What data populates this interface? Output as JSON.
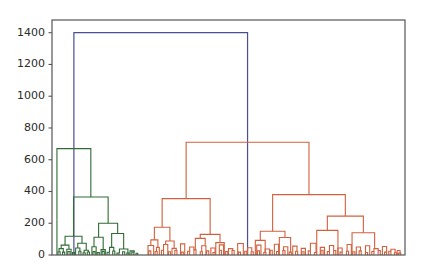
{
  "figure": {
    "background_color": "#ffffff",
    "axes_color": "#555555",
    "tick_label_color": "#2b2b2b"
  },
  "chart_data": {
    "type": "dendrogram",
    "title": "",
    "xlabel": "",
    "ylabel": "",
    "xlim": [
      0,
      100
    ],
    "ylim": [
      0,
      1480
    ],
    "grid": false,
    "legend": null,
    "yticks": [
      0,
      200,
      400,
      600,
      800,
      1000,
      1200,
      1400
    ],
    "ytick_labels": [
      "0",
      "200",
      "400",
      "600",
      "800",
      "1000",
      "1200",
      "1400"
    ],
    "xtick_labels": [],
    "link_colors": {
      "root": "#4a4f93",
      "cluster_green": "#2f6b33",
      "cluster_orange": "#d2603c"
    },
    "root_height": 1400,
    "clusters": [
      {
        "name": "green-cluster",
        "color": "#2f6b33",
        "root_height": 670,
        "x_center": 6.2,
        "x_span": [
          1.4,
          24.3
        ]
      },
      {
        "name": "orange-cluster",
        "color": "#d2603c",
        "root_height": 710,
        "x_center": 55.4,
        "x_span": [
          27.8,
          98.6
        ]
      }
    ],
    "links": [
      {
        "id": "root",
        "color": "#4a4f93",
        "height": 1400,
        "x_left": 6.2,
        "x_right": 55.4
      },
      {
        "id": "g0",
        "color": "#2f6b33",
        "height": 670,
        "x_left": 1.4,
        "x_right": 11.0
      },
      {
        "id": "g1",
        "color": "#2f6b33",
        "height": 225,
        "x_left": 1.4,
        "x_right": 1.4
      },
      {
        "id": "g2",
        "color": "#2f6b33",
        "height": 365,
        "x_left": 6.1,
        "x_right": 15.9
      },
      {
        "id": "g3",
        "color": "#2f6b33",
        "height": 118,
        "x_left": 3.7,
        "x_right": 8.5
      },
      {
        "id": "g4",
        "color": "#2f6b33",
        "height": 200,
        "x_left": 13.2,
        "x_right": 18.6
      },
      {
        "id": "g5",
        "color": "#2f6b33",
        "height": 62,
        "x_left": 2.6,
        "x_right": 4.8
      },
      {
        "id": "g6",
        "color": "#2f6b33",
        "height": 74,
        "x_left": 7.3,
        "x_right": 9.7
      },
      {
        "id": "g7",
        "color": "#2f6b33",
        "height": 112,
        "x_left": 11.9,
        "x_right": 14.5
      },
      {
        "id": "g8",
        "color": "#2f6b33",
        "height": 135,
        "x_left": 16.9,
        "x_right": 20.3
      },
      {
        "id": "g9",
        "color": "#2f6b33",
        "height": 40,
        "x_left": 2.0,
        "x_right": 3.2
      },
      {
        "id": "g10",
        "color": "#2f6b33",
        "height": 36,
        "x_left": 4.2,
        "x_right": 5.4
      },
      {
        "id": "g11",
        "color": "#2f6b33",
        "height": 44,
        "x_left": 6.7,
        "x_right": 7.9
      },
      {
        "id": "g12",
        "color": "#2f6b33",
        "height": 30,
        "x_left": 9.1,
        "x_right": 10.3
      },
      {
        "id": "g13",
        "color": "#2f6b33",
        "height": 52,
        "x_left": 11.3,
        "x_right": 12.5
      },
      {
        "id": "g14",
        "color": "#2f6b33",
        "height": 34,
        "x_left": 13.9,
        "x_right": 15.1
      },
      {
        "id": "g15",
        "color": "#2f6b33",
        "height": 48,
        "x_left": 16.3,
        "x_right": 17.5
      },
      {
        "id": "g16",
        "color": "#2f6b33",
        "height": 38,
        "x_left": 19.1,
        "x_right": 21.5
      },
      {
        "id": "g17",
        "color": "#2f6b33",
        "height": 26,
        "x_left": 22.1,
        "x_right": 23.3
      },
      {
        "id": "g18",
        "color": "#2f6b33",
        "height": 20,
        "x_left": 1.7,
        "x_right": 2.3
      },
      {
        "id": "g19",
        "color": "#2f6b33",
        "height": 18,
        "x_left": 3.0,
        "x_right": 3.6
      },
      {
        "id": "g20",
        "color": "#2f6b33",
        "height": 22,
        "x_left": 4.5,
        "x_right": 5.1
      },
      {
        "id": "g21",
        "color": "#2f6b33",
        "height": 16,
        "x_left": 5.8,
        "x_right": 6.4
      },
      {
        "id": "g22",
        "color": "#2f6b33",
        "height": 24,
        "x_left": 7.6,
        "x_right": 8.2
      },
      {
        "id": "g23",
        "color": "#2f6b33",
        "height": 14,
        "x_left": 8.8,
        "x_right": 9.4
      },
      {
        "id": "g24",
        "color": "#2f6b33",
        "height": 19,
        "x_left": 10.0,
        "x_right": 10.6
      },
      {
        "id": "g25",
        "color": "#2f6b33",
        "height": 21,
        "x_left": 11.6,
        "x_right": 12.2
      },
      {
        "id": "g26",
        "color": "#2f6b33",
        "height": 15,
        "x_left": 12.8,
        "x_right": 13.4
      },
      {
        "id": "g27",
        "color": "#2f6b33",
        "height": 23,
        "x_left": 14.2,
        "x_right": 14.8
      },
      {
        "id": "g28",
        "color": "#2f6b33",
        "height": 17,
        "x_left": 15.6,
        "x_right": 16.2
      },
      {
        "id": "g29",
        "color": "#2f6b33",
        "height": 25,
        "x_left": 17.2,
        "x_right": 17.8
      },
      {
        "id": "g30",
        "color": "#2f6b33",
        "height": 13,
        "x_left": 18.4,
        "x_right": 19.0
      },
      {
        "id": "g31",
        "color": "#2f6b33",
        "height": 20,
        "x_left": 20.0,
        "x_right": 20.6
      },
      {
        "id": "g32",
        "color": "#2f6b33",
        "height": 12,
        "x_left": 21.2,
        "x_right": 21.8
      },
      {
        "id": "g33",
        "color": "#2f6b33",
        "height": 18,
        "x_left": 22.6,
        "x_right": 23.2
      },
      {
        "id": "g34",
        "color": "#2f6b33",
        "height": 11,
        "x_left": 23.8,
        "x_right": 24.3
      },
      {
        "id": "o0",
        "color": "#d2603c",
        "height": 710,
        "x_left": 38.0,
        "x_right": 72.8
      },
      {
        "id": "o1",
        "color": "#d2603c",
        "height": 355,
        "x_left": 31.2,
        "x_right": 44.8
      },
      {
        "id": "o2",
        "color": "#d2603c",
        "height": 380,
        "x_left": 62.5,
        "x_right": 83.1
      },
      {
        "id": "o3",
        "color": "#d2603c",
        "height": 175,
        "x_left": 29.0,
        "x_right": 33.4
      },
      {
        "id": "o4",
        "color": "#d2603c",
        "height": 130,
        "x_left": 42.0,
        "x_right": 47.6
      },
      {
        "id": "o5",
        "color": "#d2603c",
        "height": 150,
        "x_left": 59.0,
        "x_right": 66.0
      },
      {
        "id": "o6",
        "color": "#d2603c",
        "height": 245,
        "x_left": 78.0,
        "x_right": 88.2
      },
      {
        "id": "o7",
        "color": "#d2603c",
        "height": 95,
        "x_left": 28.0,
        "x_right": 30.0
      },
      {
        "id": "o8",
        "color": "#d2603c",
        "height": 88,
        "x_left": 32.2,
        "x_right": 34.6
      },
      {
        "id": "o9",
        "color": "#d2603c",
        "height": 105,
        "x_left": 40.6,
        "x_right": 43.4
      },
      {
        "id": "o10",
        "color": "#d2603c",
        "height": 78,
        "x_left": 46.4,
        "x_right": 48.8
      },
      {
        "id": "o11",
        "color": "#d2603c",
        "height": 92,
        "x_left": 57.6,
        "x_right": 60.4
      },
      {
        "id": "o12",
        "color": "#d2603c",
        "height": 110,
        "x_left": 64.4,
        "x_right": 67.6
      },
      {
        "id": "o13",
        "color": "#d2603c",
        "height": 155,
        "x_left": 75.0,
        "x_right": 81.0
      },
      {
        "id": "o14",
        "color": "#d2603c",
        "height": 140,
        "x_left": 85.0,
        "x_right": 91.4
      },
      {
        "id": "o15",
        "color": "#d2603c",
        "height": 60,
        "x_left": 27.2,
        "x_right": 28.8
      },
      {
        "id": "o16",
        "color": "#d2603c",
        "height": 48,
        "x_left": 29.6,
        "x_right": 30.4
      },
      {
        "id": "o17",
        "color": "#d2603c",
        "height": 66,
        "x_left": 31.6,
        "x_right": 32.8
      },
      {
        "id": "o18",
        "color": "#d2603c",
        "height": 42,
        "x_left": 34.0,
        "x_right": 35.2
      },
      {
        "id": "o19",
        "color": "#d2603c",
        "height": 70,
        "x_left": 36.4,
        "x_right": 37.6
      },
      {
        "id": "o20",
        "color": "#d2603c",
        "height": 50,
        "x_left": 39.0,
        "x_right": 40.2
      },
      {
        "id": "o21",
        "color": "#d2603c",
        "height": 58,
        "x_left": 42.4,
        "x_right": 43.6
      },
      {
        "id": "o22",
        "color": "#d2603c",
        "height": 44,
        "x_left": 45.0,
        "x_right": 46.2
      },
      {
        "id": "o23",
        "color": "#d2603c",
        "height": 64,
        "x_left": 47.4,
        "x_right": 48.6
      },
      {
        "id": "o24",
        "color": "#d2603c",
        "height": 40,
        "x_left": 50.0,
        "x_right": 51.2
      },
      {
        "id": "o25",
        "color": "#d2603c",
        "height": 72,
        "x_left": 52.6,
        "x_right": 54.2
      },
      {
        "id": "o26",
        "color": "#d2603c",
        "height": 46,
        "x_left": 55.4,
        "x_right": 56.6
      },
      {
        "id": "o27",
        "color": "#d2603c",
        "height": 62,
        "x_left": 58.0,
        "x_right": 59.2
      },
      {
        "id": "o28",
        "color": "#d2603c",
        "height": 38,
        "x_left": 60.4,
        "x_right": 61.6
      },
      {
        "id": "o29",
        "color": "#d2603c",
        "height": 68,
        "x_left": 63.0,
        "x_right": 64.2
      },
      {
        "id": "o30",
        "color": "#d2603c",
        "height": 52,
        "x_left": 65.6,
        "x_right": 66.8
      },
      {
        "id": "o31",
        "color": "#d2603c",
        "height": 56,
        "x_left": 68.2,
        "x_right": 69.4
      },
      {
        "id": "o32",
        "color": "#d2603c",
        "height": 42,
        "x_left": 70.6,
        "x_right": 71.8
      },
      {
        "id": "o33",
        "color": "#d2603c",
        "height": 74,
        "x_left": 73.2,
        "x_right": 74.8
      },
      {
        "id": "o34",
        "color": "#d2603c",
        "height": 48,
        "x_left": 76.0,
        "x_right": 77.2
      },
      {
        "id": "o35",
        "color": "#d2603c",
        "height": 60,
        "x_left": 78.6,
        "x_right": 79.8
      },
      {
        "id": "o36",
        "color": "#d2603c",
        "height": 44,
        "x_left": 81.0,
        "x_right": 82.2
      },
      {
        "id": "o37",
        "color": "#d2603c",
        "height": 66,
        "x_left": 83.6,
        "x_right": 84.8
      },
      {
        "id": "o38",
        "color": "#d2603c",
        "height": 50,
        "x_left": 86.2,
        "x_right": 87.4
      },
      {
        "id": "o39",
        "color": "#d2603c",
        "height": 58,
        "x_left": 88.8,
        "x_right": 90.0
      },
      {
        "id": "o40",
        "color": "#d2603c",
        "height": 40,
        "x_left": 91.2,
        "x_right": 92.4
      },
      {
        "id": "o41",
        "color": "#d2603c",
        "height": 54,
        "x_left": 93.6,
        "x_right": 94.8
      },
      {
        "id": "o42",
        "color": "#d2603c",
        "height": 36,
        "x_left": 96.0,
        "x_right": 97.2
      },
      {
        "id": "o43",
        "color": "#d2603c",
        "height": 28,
        "x_left": 97.8,
        "x_right": 98.6
      },
      {
        "id": "o44",
        "color": "#d2603c",
        "height": 26,
        "x_left": 27.4,
        "x_right": 28.0
      },
      {
        "id": "o45",
        "color": "#d2603c",
        "height": 22,
        "x_left": 29.2,
        "x_right": 29.8
      },
      {
        "id": "o46",
        "color": "#d2603c",
        "height": 30,
        "x_left": 31.0,
        "x_right": 31.6
      },
      {
        "id": "o47",
        "color": "#d2603c",
        "height": 20,
        "x_left": 33.0,
        "x_right": 33.6
      },
      {
        "id": "o48",
        "color": "#d2603c",
        "height": 28,
        "x_left": 34.8,
        "x_right": 35.4
      },
      {
        "id": "o49",
        "color": "#d2603c",
        "height": 18,
        "x_left": 36.6,
        "x_right": 37.2
      },
      {
        "id": "o50",
        "color": "#d2603c",
        "height": 24,
        "x_left": 38.4,
        "x_right": 39.0
      },
      {
        "id": "o51",
        "color": "#d2603c",
        "height": 32,
        "x_left": 40.2,
        "x_right": 40.8
      },
      {
        "id": "o52",
        "color": "#d2603c",
        "height": 20,
        "x_left": 42.0,
        "x_right": 42.6
      },
      {
        "id": "o53",
        "color": "#d2603c",
        "height": 26,
        "x_left": 43.8,
        "x_right": 44.4
      },
      {
        "id": "o54",
        "color": "#d2603c",
        "height": 16,
        "x_left": 45.6,
        "x_right": 46.2
      },
      {
        "id": "o55",
        "color": "#d2603c",
        "height": 30,
        "x_left": 47.4,
        "x_right": 48.0
      },
      {
        "id": "o56",
        "color": "#d2603c",
        "height": 22,
        "x_left": 49.2,
        "x_right": 49.8
      },
      {
        "id": "o57",
        "color": "#d2603c",
        "height": 28,
        "x_left": 51.0,
        "x_right": 51.6
      },
      {
        "id": "o58",
        "color": "#d2603c",
        "height": 18,
        "x_left": 52.8,
        "x_right": 53.4
      },
      {
        "id": "o59",
        "color": "#d2603c",
        "height": 24,
        "x_left": 54.6,
        "x_right": 55.2
      },
      {
        "id": "o60",
        "color": "#d2603c",
        "height": 20,
        "x_left": 56.4,
        "x_right": 57.0
      },
      {
        "id": "o61",
        "color": "#d2603c",
        "height": 26,
        "x_left": 58.2,
        "x_right": 58.8
      },
      {
        "id": "o62",
        "color": "#d2603c",
        "height": 16,
        "x_left": 60.0,
        "x_right": 60.6
      },
      {
        "id": "o63",
        "color": "#d2603c",
        "height": 30,
        "x_left": 61.8,
        "x_right": 62.4
      },
      {
        "id": "o64",
        "color": "#d2603c",
        "height": 22,
        "x_left": 63.6,
        "x_right": 64.2
      },
      {
        "id": "o65",
        "color": "#d2603c",
        "height": 28,
        "x_left": 65.4,
        "x_right": 66.0
      },
      {
        "id": "o66",
        "color": "#d2603c",
        "height": 18,
        "x_left": 67.2,
        "x_right": 67.8
      },
      {
        "id": "o67",
        "color": "#d2603c",
        "height": 24,
        "x_left": 69.0,
        "x_right": 69.6
      },
      {
        "id": "o68",
        "color": "#d2603c",
        "height": 20,
        "x_left": 70.8,
        "x_right": 71.4
      },
      {
        "id": "o69",
        "color": "#d2603c",
        "height": 26,
        "x_left": 72.6,
        "x_right": 73.2
      },
      {
        "id": "o70",
        "color": "#d2603c",
        "height": 16,
        "x_left": 74.4,
        "x_right": 75.0
      },
      {
        "id": "o71",
        "color": "#d2603c",
        "height": 30,
        "x_left": 76.2,
        "x_right": 76.8
      },
      {
        "id": "o72",
        "color": "#d2603c",
        "height": 22,
        "x_left": 78.0,
        "x_right": 78.6
      },
      {
        "id": "o73",
        "color": "#d2603c",
        "height": 28,
        "x_left": 79.8,
        "x_right": 80.4
      },
      {
        "id": "o74",
        "color": "#d2603c",
        "height": 18,
        "x_left": 81.6,
        "x_right": 82.2
      },
      {
        "id": "o75",
        "color": "#d2603c",
        "height": 24,
        "x_left": 83.4,
        "x_right": 84.0
      },
      {
        "id": "o76",
        "color": "#d2603c",
        "height": 20,
        "x_left": 85.2,
        "x_right": 85.8
      },
      {
        "id": "o77",
        "color": "#d2603c",
        "height": 26,
        "x_left": 87.0,
        "x_right": 87.6
      },
      {
        "id": "o78",
        "color": "#d2603c",
        "height": 16,
        "x_left": 88.8,
        "x_right": 89.4
      },
      {
        "id": "o79",
        "color": "#d2603c",
        "height": 22,
        "x_left": 90.6,
        "x_right": 91.2
      },
      {
        "id": "o80",
        "color": "#d2603c",
        "height": 28,
        "x_left": 92.4,
        "x_right": 93.0
      },
      {
        "id": "o81",
        "color": "#d2603c",
        "height": 18,
        "x_left": 94.2,
        "x_right": 94.8
      },
      {
        "id": "o82",
        "color": "#d2603c",
        "height": 24,
        "x_left": 95.4,
        "x_right": 96.0
      },
      {
        "id": "o83",
        "color": "#d2603c",
        "height": 14,
        "x_left": 97.0,
        "x_right": 97.6
      },
      {
        "id": "o84",
        "color": "#d2603c",
        "height": 12,
        "x_left": 98.2,
        "x_right": 98.8
      }
    ]
  }
}
